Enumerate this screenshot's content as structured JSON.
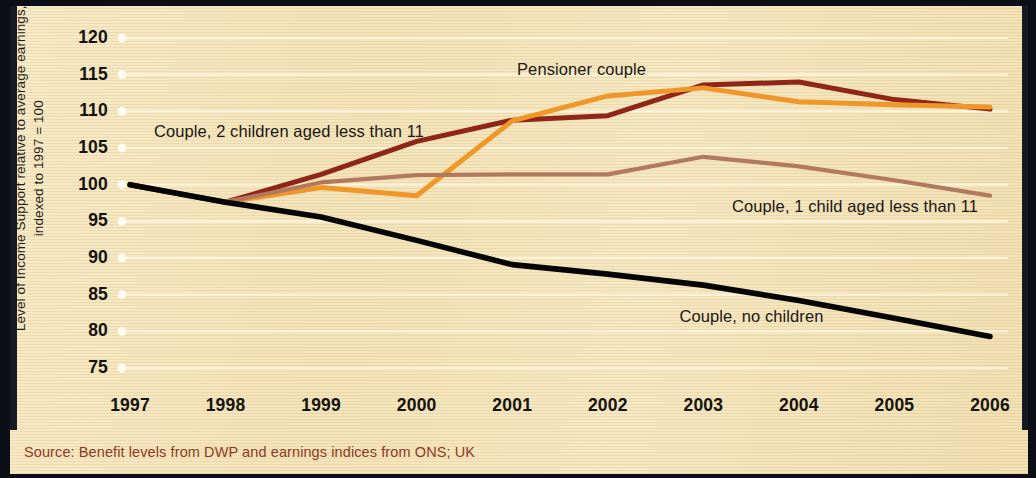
{
  "figure": {
    "source_note": "Source: Benefit levels from DWP and earnings indices from ONS; UK",
    "paper_color": "#f4e4b9",
    "border_color": "#11131c",
    "source_color": "#8e3a22"
  },
  "chart_data": {
    "type": "line",
    "title": "",
    "xlabel": "",
    "ylabel": "Level of Income Support relative to average earnings, indexed to 1997 = 100",
    "x": [
      1997,
      1998,
      1999,
      2000,
      2001,
      2002,
      2003,
      2004,
      2005,
      2006
    ],
    "xticklabels": [
      "1997",
      "1998",
      "1999",
      "2000",
      "2001",
      "2002",
      "2003",
      "2004",
      "2005",
      "2006"
    ],
    "yticks": [
      75,
      80,
      85,
      90,
      95,
      100,
      105,
      110,
      115,
      120
    ],
    "yticklabels": [
      "75",
      "80",
      "85",
      "90",
      "95",
      "100",
      "105",
      "110",
      "115",
      "120"
    ],
    "ylim": [
      75,
      120
    ],
    "xlim": [
      1997,
      2006
    ],
    "grid": "horizontal",
    "legend": "inline-annotations",
    "series": [
      {
        "name": "Couple, 2 children aged less than 11",
        "color": "#8f2617",
        "width": 5.0,
        "values": [
          100.0,
          97.6,
          101.4,
          105.9,
          108.8,
          109.4,
          113.6,
          114.0,
          111.6,
          110.3
        ],
        "label_x": 1997.25,
        "label_y": 107.2
      },
      {
        "name": "Pensioner couple",
        "color": "#f0972a",
        "width": 5.0,
        "values": [
          100.0,
          97.6,
          99.6,
          98.5,
          108.7,
          112.1,
          113.2,
          111.3,
          110.9,
          110.6
        ],
        "label_x": 2001.05,
        "label_y": 115.6
      },
      {
        "name": "Couple, 1 child aged less than 11",
        "color": "#b2795f",
        "width": 4.2,
        "values": [
          100.0,
          97.6,
          100.3,
          101.3,
          101.4,
          101.4,
          103.8,
          102.5,
          100.6,
          98.5
        ],
        "label_x": 2003.3,
        "label_y": 97.0
      },
      {
        "name": "Couple, no children",
        "color": "#050505",
        "width": 5.6,
        "values": [
          100.0,
          97.6,
          95.6,
          92.4,
          89.1,
          87.8,
          86.3,
          84.2,
          81.8,
          79.3
        ],
        "label_x": 2002.75,
        "label_y": 81.9
      }
    ]
  }
}
